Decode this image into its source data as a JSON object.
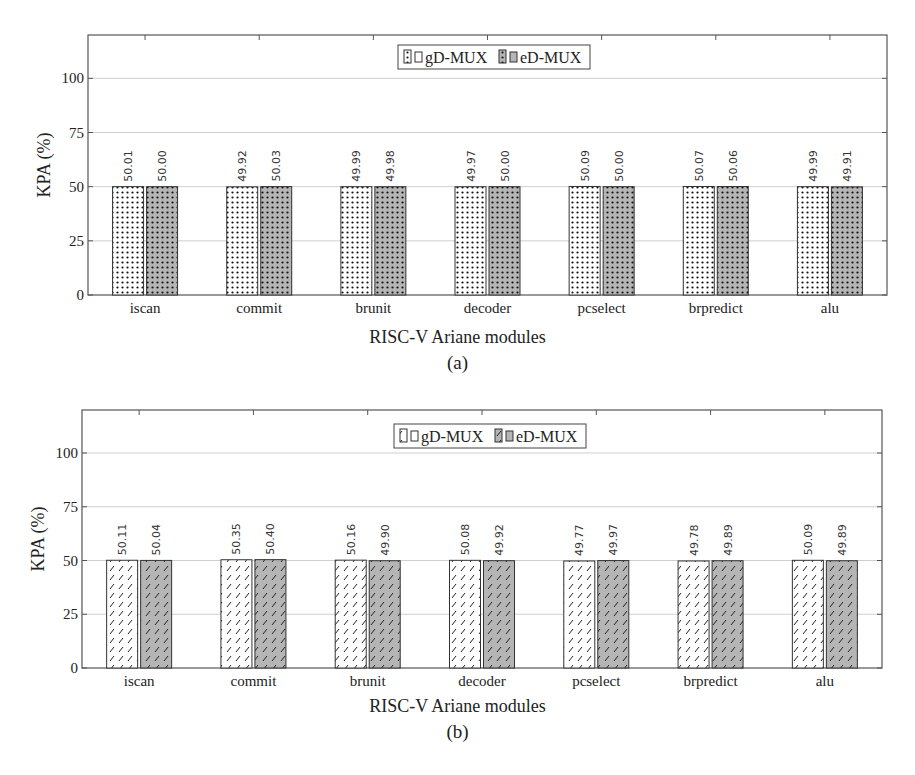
{
  "chart_data": [
    {
      "id": "a",
      "type": "bar",
      "title": "",
      "caption": "(a)",
      "xlabel": "RISC-V Ariane modules",
      "ylabel": "KPA (%)",
      "ylim": [
        0,
        120
      ],
      "yticks": [
        0,
        25,
        50,
        75,
        100
      ],
      "grid": true,
      "legend_position": "top-center",
      "pattern": "dots",
      "categories": [
        "iscan",
        "commit",
        "brunit",
        "decoder",
        "pcselect",
        "brpredict",
        "alu"
      ],
      "series": [
        {
          "name": "gD-MUX",
          "fill": "#ffffff",
          "values": [
            50.01,
            49.92,
            49.99,
            49.97,
            50.09,
            50.07,
            49.99
          ],
          "labels": [
            "50.01",
            "49.92",
            "49.99",
            "49.97",
            "50.09",
            "50.07",
            "49.99"
          ]
        },
        {
          "name": "eD-MUX",
          "fill": "#b5b5b5",
          "values": [
            50.0,
            50.03,
            49.98,
            50.0,
            50.0,
            50.06,
            49.91
          ],
          "labels": [
            "50.00",
            "50.03",
            "49.98",
            "50.00",
            "50.00",
            "50.06",
            "49.91"
          ]
        }
      ]
    },
    {
      "id": "b",
      "type": "bar",
      "title": "",
      "caption": "(b)",
      "xlabel": "RISC-V Ariane modules",
      "ylabel": "KPA (%)",
      "ylim": [
        0,
        120
      ],
      "yticks": [
        0,
        25,
        50,
        75,
        100
      ],
      "grid": true,
      "legend_position": "top-center",
      "pattern": "hatch",
      "categories": [
        "iscan",
        "commit",
        "brunit",
        "decoder",
        "pcselect",
        "brpredict",
        "alu"
      ],
      "series": [
        {
          "name": "gD-MUX",
          "fill": "#ffffff",
          "values": [
            50.11,
            50.35,
            50.16,
            50.08,
            49.77,
            49.78,
            50.09
          ],
          "labels": [
            "50.11",
            "50.35",
            "50.16",
            "50.08",
            "49.77",
            "49.78",
            "50.09"
          ]
        },
        {
          "name": "eD-MUX",
          "fill": "#b5b5b5",
          "values": [
            50.04,
            50.4,
            49.9,
            49.92,
            49.97,
            49.89,
            49.89
          ],
          "labels": [
            "50.04",
            "50.40",
            "49.90",
            "49.92",
            "49.97",
            "49.89",
            "49.89"
          ]
        }
      ]
    }
  ]
}
